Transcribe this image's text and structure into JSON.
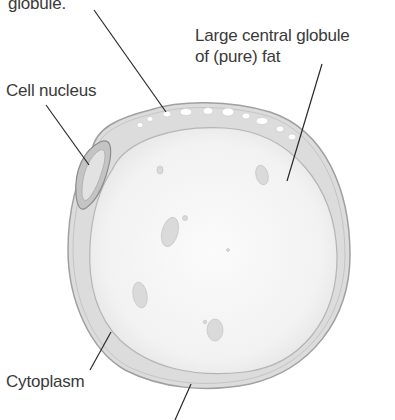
{
  "diagram": {
    "labels": [
      {
        "id": "globule",
        "text": "globule."
      },
      {
        "id": "central-fat",
        "line1": "Large central globule",
        "line2": "of (pure) fat"
      },
      {
        "id": "nucleus",
        "text": "Cell nucleus"
      },
      {
        "id": "cytoplasm",
        "text": "Cytoplasm"
      }
    ],
    "colors": {
      "background": "#ffffff",
      "cell_fill": "#f3f3f3",
      "membrane": "#b8b8b8",
      "cytoplasm": "#dcdcdc",
      "nucleus": "#c8c8c8",
      "leader_line": "#2a2a2a",
      "text": "#3a3a3a"
    }
  }
}
